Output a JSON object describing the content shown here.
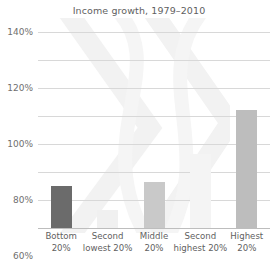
{
  "chart_data": {
    "type": "bar",
    "title": "Income growth, 1979–2010",
    "xlabel": "",
    "ylabel": "",
    "categories": [
      "Bottom 20%",
      "Second lowest 20%",
      "Middle 20%",
      "Second highest 20%",
      "Highest 20%"
    ],
    "category_lines": [
      [
        "Bottom",
        "20%"
      ],
      [
        "Second",
        "lowest 20%"
      ],
      [
        "Middle",
        "20%"
      ],
      [
        "Second",
        "highest 20%"
      ],
      [
        "Highest",
        "20%"
      ]
    ],
    "values": [
      30,
      13,
      33,
      53,
      84
    ],
    "value_labels": [
      "30%",
      "13%",
      "33%",
      "53%",
      "84%"
    ],
    "bar_colors": [
      "#6b6b6b",
      "#f0f0f0",
      "#c9c9c9",
      "#f4f4f4",
      "#bdbdbd"
    ],
    "ylim": [
      0,
      140
    ],
    "ytick_values": [
      0,
      20,
      40,
      60,
      80,
      100,
      120,
      140
    ],
    "ytick_labels": [
      "0%",
      "20%",
      "40%",
      "60%",
      "80%",
      "100%",
      "120%",
      "140%"
    ],
    "grid": true,
    "legend": "none",
    "axis_color": "#bdbdbd",
    "grid_color": "#d8d8d8",
    "text_color": "#5f5f5f",
    "background": "#ffffff",
    "watermark_color": "#f4f4f4"
  }
}
